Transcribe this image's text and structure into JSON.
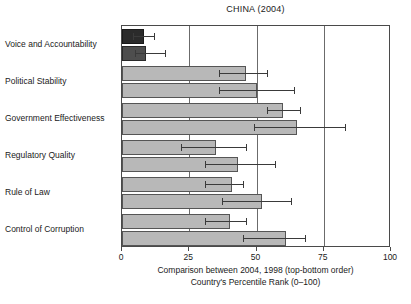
{
  "chart_data": {
    "type": "bar",
    "orientation": "horizontal",
    "title": "CHINA (2004)",
    "xlabel": "",
    "ylabel": "",
    "xlim": [
      0,
      100
    ],
    "xticks": [
      0,
      25,
      50,
      75,
      100
    ],
    "xtick_labels": [
      "0",
      "25",
      "50",
      "75",
      "100"
    ],
    "grid": true,
    "grid_axis": "x",
    "legend": "none",
    "categories": [
      "Voice and Accountability",
      "Political Stability",
      "Government Effectiveness",
      "Regulatory Quality",
      "Rule of Law",
      "Control of Corruption"
    ],
    "series": [
      {
        "name": "2004",
        "position": "top",
        "values": [
          8,
          46,
          60,
          35,
          41,
          40
        ],
        "err_low": [
          4,
          36,
          54,
          22,
          31,
          31
        ],
        "err_high": [
          12,
          54,
          66,
          46,
          45,
          46
        ]
      },
      {
        "name": "1998",
        "position": "bottom",
        "values": [
          9,
          50,
          65,
          43,
          52,
          61
        ],
        "err_low": [
          5,
          36,
          49,
          31,
          37,
          45
        ],
        "err_high": [
          16,
          64,
          83,
          57,
          63,
          68
        ]
      }
    ],
    "annotations": [
      "Comparison between 2004, 1998 (top-bottom order)",
      "Country's Percentile Rank (0–100)"
    ],
    "colors": {
      "bar_light": "#b8b8b8",
      "bar_dark_2004": "#2b2b2b",
      "bar_dark_1998": "#4e4e4e",
      "bar_border": "#555555",
      "error_bar": "#3a3a3a",
      "axis": "#4a4a4a",
      "grid": "#6b6b6b",
      "text": "#1a1a1a",
      "background": "#ffffff"
    }
  },
  "captions": {
    "line1": "Comparison between 2004, 1998 (top-bottom order)",
    "line2": "Country's Percentile Rank (0–100)"
  }
}
